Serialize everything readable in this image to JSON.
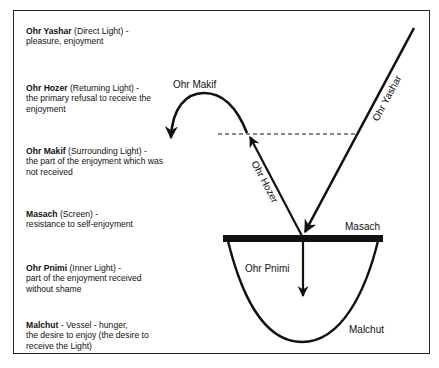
{
  "legend": [
    {
      "term": "Ohr Yashar",
      "rest": " (Direct Light) -",
      "desc": "pleasure, enjoyment"
    },
    {
      "term": "Ohr Hozer",
      "rest": " (Returning Light) -",
      "desc": "the primary refusal to receive the enjoyment"
    },
    {
      "term": "Ohr Makif",
      "rest": " (Surrounding Light) -",
      "desc": "the part of the enjoyment which was not received"
    },
    {
      "term": "Masach",
      "rest": " (Screen) -",
      "desc": "resistance to self-enjoyment"
    },
    {
      "term": "Ohr Pnimi",
      "rest": " (Inner Light) -",
      "desc": "part of the enjoyment received without shame"
    },
    {
      "term": "Malchut",
      "rest": " - Vessel - hunger,",
      "desc": "the desire to enjoy (the desire to receive the Light)"
    }
  ],
  "diagram": {
    "labels": {
      "ohr_makif": "Ohr Makif",
      "ohr_yashar": "Ohr Yashar",
      "ohr_hozer": "Ohr Hozer",
      "masach": "Masach",
      "ohr_pnimi": "Ohr Pnimi",
      "malchut": "Malchut"
    },
    "colors": {
      "ink": "#111111",
      "background": "#ffffff"
    }
  }
}
